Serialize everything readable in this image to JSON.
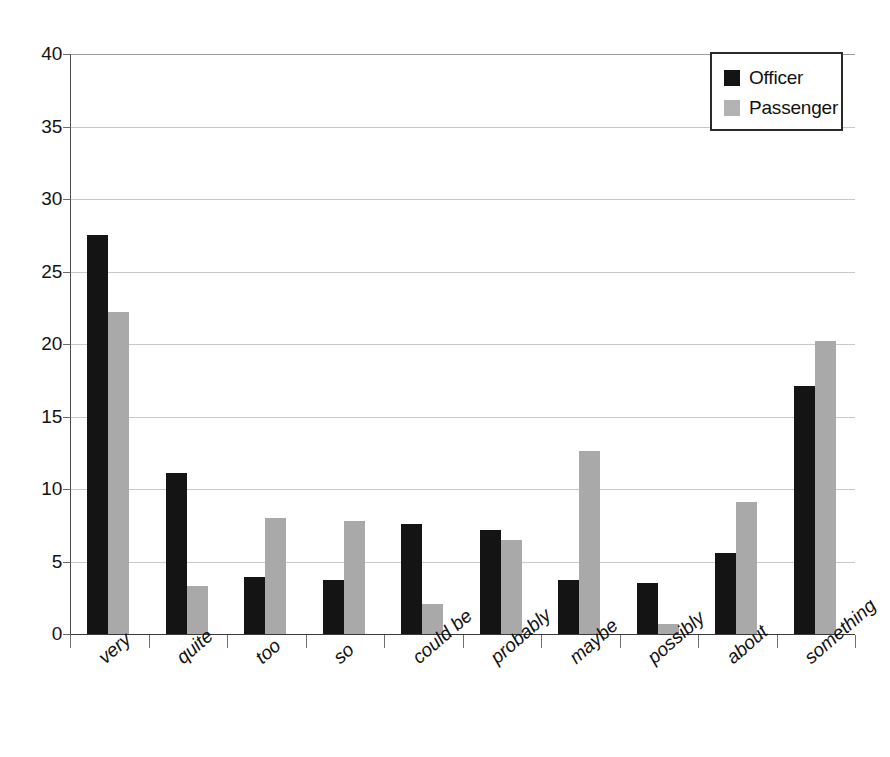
{
  "chart_data": {
    "type": "bar",
    "title": "",
    "subtitle": "",
    "xlabel": "",
    "ylabel": "",
    "ylim": [
      0,
      40
    ],
    "ytick_step": 5,
    "yticks": [
      40,
      35,
      30,
      25,
      20,
      15,
      10,
      5,
      0
    ],
    "grid": true,
    "legend_position": "top-right",
    "categories": [
      "very",
      "quite",
      "too",
      "so",
      "could be",
      "probably",
      "maybe",
      "possibly",
      "about",
      "something"
    ],
    "series": [
      {
        "name": "Officer",
        "color": "#141414",
        "values": [
          27.5,
          11.1,
          3.9,
          3.7,
          7.6,
          7.2,
          3.7,
          3.5,
          5.6,
          17.1
        ]
      },
      {
        "name": "Passenger",
        "color": "#a9a9a9",
        "values": [
          22.2,
          3.3,
          8.0,
          7.8,
          2.1,
          6.5,
          12.6,
          0.7,
          9.1,
          20.2
        ]
      }
    ]
  },
  "legend": {
    "entries": [
      {
        "label": "Officer",
        "swatch": "officer"
      },
      {
        "label": "Passenger",
        "swatch": "passenger"
      }
    ]
  }
}
